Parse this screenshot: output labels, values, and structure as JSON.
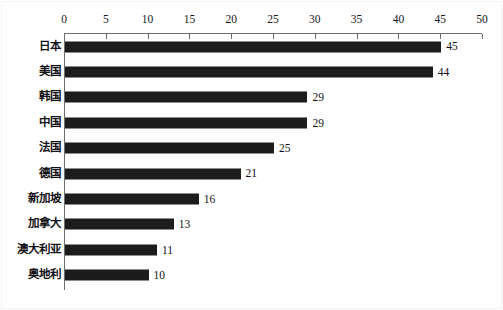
{
  "chart_data": {
    "type": "bar",
    "orientation": "horizontal",
    "title": "",
    "subtitle": "",
    "xlabel": "",
    "ylabel": "",
    "xlim": [
      0,
      50
    ],
    "ylim": null,
    "grid": false,
    "legend": null,
    "legend_position": "none",
    "axis_position": "top",
    "tick_labels": [
      "0",
      "5",
      "10",
      "15",
      "20",
      "25",
      "30",
      "35",
      "40",
      "45",
      "50"
    ],
    "ticks": [
      0,
      5,
      10,
      15,
      20,
      25,
      30,
      35,
      40,
      45,
      50
    ],
    "categories": [
      "日本",
      "美国",
      "韩国",
      "中国",
      "法国",
      "德国",
      "新加坡",
      "加拿大",
      "澳大利亚",
      "奥地利"
    ],
    "values": [
      45,
      44,
      29,
      29,
      25,
      21,
      16,
      13,
      11,
      10
    ],
    "value_labels": [
      "45",
      "44",
      "29",
      "29",
      "25",
      "21",
      "16",
      "13",
      "11",
      "10"
    ],
    "series": [
      {
        "name": "",
        "values": [
          45,
          44,
          29,
          29,
          25,
          21,
          16,
          13,
          11,
          10
        ]
      }
    ],
    "rows": [
      {
        "category": "日本",
        "value": 45,
        "label": "45"
      },
      {
        "category": "美国",
        "value": 44,
        "label": "44"
      },
      {
        "category": "韩国",
        "value": 29,
        "label": "29"
      },
      {
        "category": "中国",
        "value": 29,
        "label": "29"
      },
      {
        "category": "法国",
        "value": 25,
        "label": "25"
      },
      {
        "category": "德国",
        "value": 21,
        "label": "21"
      },
      {
        "category": "新加坡",
        "value": 16,
        "label": "16"
      },
      {
        "category": "加拿大",
        "value": 13,
        "label": "13"
      },
      {
        "category": "澳大利亚",
        "value": 11,
        "label": "11"
      },
      {
        "category": "奥地利",
        "value": 10,
        "label": "10"
      }
    ],
    "colors": {
      "bar": "#1c1c1c",
      "axis": "#6f6f72",
      "text": "#101014",
      "background": "#ffffff",
      "frame": "#f4f4f5"
    }
  }
}
